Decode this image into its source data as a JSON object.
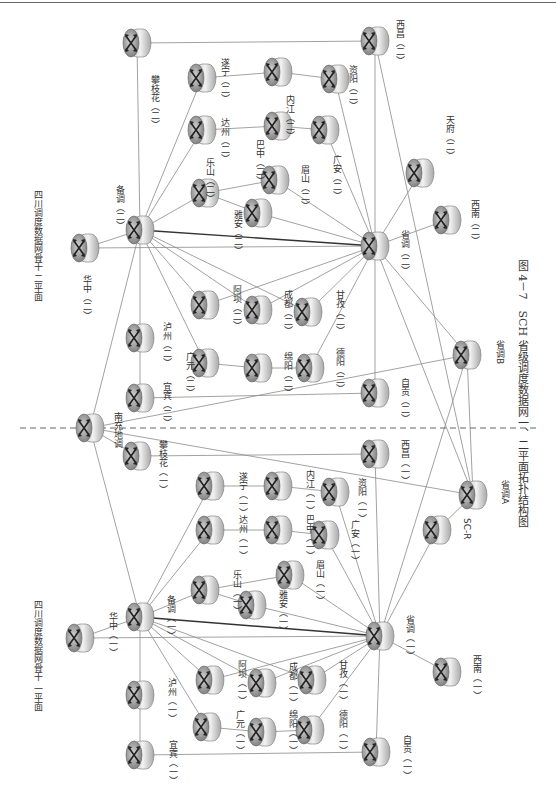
{
  "caption": "图 4－7　SCH 省级调度数据网一、二平面拓扑结构图",
  "plane_labels": {
    "plane2": "四川调度数据网骨干\n二平面",
    "plane1": "四川调度数据网骨干\n一平面"
  },
  "divider": {
    "style": "dashed",
    "y": 428
  },
  "colors": {
    "line": "#8a8a8a",
    "heavy_line": "#333333",
    "router_body": "#d8d8d8",
    "router_face": "#9a9a9a",
    "text": "#333333"
  },
  "nodes": [
    {
      "id": "panzhihua2",
      "label": "攀枝花（二）",
      "x": 137,
      "y": 43,
      "lx": 150,
      "ly": 75
    },
    {
      "id": "xichang2",
      "label": "西昌（二）",
      "x": 375,
      "y": 41,
      "lx": 395,
      "ly": 20
    },
    {
      "id": "suining2",
      "label": "遂宁（二）",
      "x": 202,
      "y": 78,
      "lx": 220,
      "ly": 58
    },
    {
      "id": "neijiang2",
      "label": "内江（二）",
      "x": 278,
      "y": 72,
      "lx": 285,
      "ly": 95
    },
    {
      "id": "ziyang2",
      "label": "资阳（二）",
      "x": 335,
      "y": 79,
      "lx": 348,
      "ly": 65
    },
    {
      "id": "dazhou2",
      "label": "达州（二）",
      "x": 202,
      "y": 130,
      "lx": 220,
      "ly": 118
    },
    {
      "id": "bazhong2",
      "label": "巴中（二）",
      "x": 278,
      "y": 126,
      "lx": 255,
      "ly": 140
    },
    {
      "id": "guangan2",
      "label": "广安（二）",
      "x": 325,
      "y": 130,
      "lx": 332,
      "ly": 155
    },
    {
      "id": "leshan2",
      "label": "乐山（二）",
      "x": 205,
      "y": 193,
      "lx": 205,
      "ly": 158
    },
    {
      "id": "meishan2",
      "label": "眉山（二）",
      "x": 275,
      "y": 180,
      "lx": 300,
      "ly": 165
    },
    {
      "id": "yaan2",
      "label": "雅安（二）",
      "x": 258,
      "y": 213,
      "lx": 233,
      "ly": 210
    },
    {
      "id": "tianfu2",
      "label": "天府（二）",
      "x": 420,
      "y": 173,
      "lx": 445,
      "ly": 115
    },
    {
      "id": "beidiao2",
      "label": "备调（二）",
      "x": 140,
      "y": 230,
      "lx": 115,
      "ly": 185
    },
    {
      "id": "huazhong2",
      "label": "华中（二）",
      "x": 85,
      "y": 248,
      "lx": 82,
      "ly": 275
    },
    {
      "id": "shengdiao2",
      "label": "省调（二）",
      "x": 375,
      "y": 246,
      "lx": 400,
      "ly": 230
    },
    {
      "id": "xinan2",
      "label": "西南（二）",
      "x": 447,
      "y": 220,
      "lx": 470,
      "ly": 200
    },
    {
      "id": "aba2",
      "label": "阿坝（二）",
      "x": 205,
      "y": 305,
      "lx": 232,
      "ly": 285
    },
    {
      "id": "chengdu2",
      "label": "成都（二）",
      "x": 258,
      "y": 310,
      "lx": 283,
      "ly": 290
    },
    {
      "id": "ganzi2",
      "label": "甘孜（二）",
      "x": 308,
      "y": 312,
      "lx": 335,
      "ly": 290
    },
    {
      "id": "luzhou2",
      "label": "泸州（二）",
      "x": 140,
      "y": 338,
      "lx": 162,
      "ly": 322
    },
    {
      "id": "guangyuan2",
      "label": "广元（二）",
      "x": 205,
      "y": 363,
      "lx": 185,
      "ly": 352
    },
    {
      "id": "mianyang2",
      "label": "绵阳（二）",
      "x": 258,
      "y": 368,
      "lx": 283,
      "ly": 352
    },
    {
      "id": "deyang2",
      "label": "德阳（二）",
      "x": 310,
      "y": 368,
      "lx": 335,
      "ly": 348
    },
    {
      "id": "yibin2",
      "label": "宜宾（二）",
      "x": 140,
      "y": 398,
      "lx": 162,
      "ly": 382
    },
    {
      "id": "zigong2",
      "label": "自贡（二）",
      "x": 375,
      "y": 393,
      "lx": 400,
      "ly": 378
    },
    {
      "id": "shengdiaoB",
      "label": "省调B",
      "x": 467,
      "y": 355,
      "lx": 495,
      "ly": 340
    },
    {
      "id": "nanchong",
      "label": "南充地调",
      "x": 90,
      "y": 428,
      "lx": 113,
      "ly": 412
    },
    {
      "id": "panzhihua1",
      "label": "攀枝花（一）",
      "x": 137,
      "y": 456,
      "lx": 158,
      "ly": 440
    },
    {
      "id": "xichang1",
      "label": "西昌（一）",
      "x": 375,
      "y": 454,
      "lx": 400,
      "ly": 440
    },
    {
      "id": "suining1",
      "label": "遂宁（一）",
      "x": 210,
      "y": 486,
      "lx": 238,
      "ly": 472
    },
    {
      "id": "neijiang1",
      "label": "内江（一）",
      "x": 278,
      "y": 486,
      "lx": 305,
      "ly": 470
    },
    {
      "id": "ziyang1",
      "label": "资阳（一）",
      "x": 335,
      "y": 492,
      "lx": 357,
      "ly": 478
    },
    {
      "id": "dazhou1",
      "label": "达州（一）",
      "x": 210,
      "y": 530,
      "lx": 238,
      "ly": 515
    },
    {
      "id": "bazhong1",
      "label": "巴中（一）",
      "x": 278,
      "y": 530,
      "lx": 305,
      "ly": 515
    },
    {
      "id": "guangan1",
      "label": "广安（一）",
      "x": 325,
      "y": 535,
      "lx": 350,
      "ly": 520
    },
    {
      "id": "shengdiaoA",
      "label": "省调A",
      "x": 473,
      "y": 495,
      "lx": 500,
      "ly": 480
    },
    {
      "id": "leshan1",
      "label": "乐山（一）",
      "x": 205,
      "y": 590,
      "lx": 232,
      "ly": 570
    },
    {
      "id": "meishan1",
      "label": "眉山（一）",
      "x": 290,
      "y": 575,
      "lx": 315,
      "ly": 560
    },
    {
      "id": "yaan1",
      "label": "雅安（一）",
      "x": 252,
      "y": 605,
      "lx": 278,
      "ly": 590
    },
    {
      "id": "scr",
      "label": "SC-R",
      "x": 437,
      "y": 530,
      "lx": 462,
      "ly": 518
    },
    {
      "id": "huazhong1",
      "label": "华中（一）",
      "x": 80,
      "y": 638,
      "lx": 108,
      "ly": 612
    },
    {
      "id": "beidiao1",
      "label": "备调（一）",
      "x": 140,
      "y": 617,
      "lx": 166,
      "ly": 595
    },
    {
      "id": "shengdiao1",
      "label": "省调（一）",
      "x": 380,
      "y": 636,
      "lx": 405,
      "ly": 615
    },
    {
      "id": "xinan1",
      "label": "西南（一）",
      "x": 447,
      "y": 672,
      "lx": 472,
      "ly": 655
    },
    {
      "id": "aba1",
      "label": "阿坝（一）",
      "x": 210,
      "y": 680,
      "lx": 237,
      "ly": 660
    },
    {
      "id": "chengdu1",
      "label": "成都（一）",
      "x": 262,
      "y": 683,
      "lx": 288,
      "ly": 662
    },
    {
      "id": "ganzi1",
      "label": "甘孜（一）",
      "x": 312,
      "y": 680,
      "lx": 338,
      "ly": 660
    },
    {
      "id": "luzhou1",
      "label": "泸州（一）",
      "x": 140,
      "y": 695,
      "lx": 167,
      "ly": 678
    },
    {
      "id": "guangyuan1",
      "label": "广元（一）",
      "x": 207,
      "y": 727,
      "lx": 235,
      "ly": 710
    },
    {
      "id": "mianyang1",
      "label": "绵阳（一）",
      "x": 262,
      "y": 732,
      "lx": 288,
      "ly": 710
    },
    {
      "id": "deyang1",
      "label": "德阳（一）",
      "x": 310,
      "y": 730,
      "lx": 338,
      "ly": 710
    },
    {
      "id": "yibin1",
      "label": "宜宾（一）",
      "x": 140,
      "y": 755,
      "lx": 168,
      "ly": 740
    },
    {
      "id": "zigong1",
      "label": "自贡（一）",
      "x": 376,
      "y": 752,
      "lx": 402,
      "ly": 735
    }
  ],
  "links": [
    [
      "panzhihua2",
      "xichang2"
    ],
    [
      "panzhihua2",
      "beidiao2"
    ],
    [
      "xichang2",
      "shengdiao2"
    ],
    [
      "suining2",
      "neijiang2"
    ],
    [
      "neijiang2",
      "ziyang2"
    ],
    [
      "ziyang2",
      "shengdiao2"
    ],
    [
      "dazhou2",
      "bazhong2"
    ],
    [
      "bazhong2",
      "guangan2"
    ],
    [
      "guangan2",
      "shengdiao2"
    ],
    [
      "leshan2",
      "meishan2"
    ],
    [
      "meishan2",
      "shengdiao2"
    ],
    [
      "leshan2",
      "yaan2"
    ],
    [
      "yaan2",
      "shengdiao2"
    ],
    [
      "beidiao2",
      "suining2"
    ],
    [
      "beidiao2",
      "dazhou2"
    ],
    [
      "beidiao2",
      "leshan2"
    ],
    [
      "beidiao2",
      "huazhong2"
    ],
    [
      "huazhong2",
      "shengdiao2"
    ],
    [
      "beidiao2",
      "shengdiao2",
      "heavy"
    ],
    [
      "shengdiao2",
      "tianfu2"
    ],
    [
      "shengdiao2",
      "xinan2"
    ],
    [
      "beidiao2",
      "aba2"
    ],
    [
      "beidiao2",
      "chengdu2"
    ],
    [
      "beidiao2",
      "ganzi2"
    ],
    [
      "aba2",
      "shengdiao2"
    ],
    [
      "chengdu2",
      "shengdiao2"
    ],
    [
      "ganzi2",
      "shengdiao2"
    ],
    [
      "beidiao2",
      "luzhou2"
    ],
    [
      "luzhou2",
      "yibin2"
    ],
    [
      "beidiao2",
      "guangyuan2"
    ],
    [
      "guangyuan2",
      "mianyang2"
    ],
    [
      "mianyang2",
      "deyang2"
    ],
    [
      "deyang2",
      "shengdiao2"
    ],
    [
      "yibin2",
      "zigong2"
    ],
    [
      "shengdiao2",
      "zigong2"
    ],
    [
      "shengdiao2",
      "shengdiaoB"
    ],
    [
      "shengdiao2",
      "shengdiaoA"
    ],
    [
      "beidiao2",
      "nanchong"
    ],
    [
      "nanchong",
      "shengdiaoB"
    ],
    [
      "nanchong",
      "panzhihua1"
    ],
    [
      "nanchong",
      "beidiao1"
    ],
    [
      "panzhihua1",
      "xichang1"
    ],
    [
      "xichang1",
      "shengdiao1"
    ],
    [
      "suining1",
      "neijiang1"
    ],
    [
      "neijiang1",
      "ziyang1"
    ],
    [
      "ziyang1",
      "shengdiao1"
    ],
    [
      "dazhou1",
      "bazhong1"
    ],
    [
      "bazhong1",
      "guangan1"
    ],
    [
      "guangan1",
      "shengdiao1"
    ],
    [
      "leshan1",
      "meishan1"
    ],
    [
      "meishan1",
      "shengdiao1"
    ],
    [
      "leshan1",
      "yaan1"
    ],
    [
      "yaan1",
      "shengdiao1"
    ],
    [
      "beidiao1",
      "suining1"
    ],
    [
      "beidiao1",
      "dazhou1"
    ],
    [
      "beidiao1",
      "leshan1"
    ],
    [
      "beidiao1",
      "huazhong1"
    ],
    [
      "huazhong1",
      "shengdiao1"
    ],
    [
      "beidiao1",
      "shengdiao1",
      "heavy"
    ],
    [
      "shengdiao1",
      "xinan1"
    ],
    [
      "shengdiao1",
      "scr"
    ],
    [
      "scr",
      "shengdiaoA"
    ],
    [
      "shengdiaoA",
      "shengdiaoB"
    ],
    [
      "shengdiao1",
      "shengdiaoB"
    ],
    [
      "xichang2",
      "shengdiaoA"
    ],
    [
      "beidiao1",
      "aba1"
    ],
    [
      "beidiao1",
      "chengdu1"
    ],
    [
      "beidiao1",
      "ganzi1"
    ],
    [
      "aba1",
      "shengdiao1"
    ],
    [
      "chengdu1",
      "shengdiao1"
    ],
    [
      "ganzi1",
      "shengdiao1"
    ],
    [
      "beidiao1",
      "luzhou1"
    ],
    [
      "luzhou1",
      "yibin1"
    ],
    [
      "beidiao1",
      "guangyuan1"
    ],
    [
      "guangyuan1",
      "mianyang1"
    ],
    [
      "mianyang1",
      "deyang1"
    ],
    [
      "deyang1",
      "shengdiao1"
    ],
    [
      "yibin1",
      "zigong1"
    ],
    [
      "shengdiao1",
      "zigong1"
    ],
    [
      "nanchong",
      "shengdiaoA"
    ]
  ]
}
